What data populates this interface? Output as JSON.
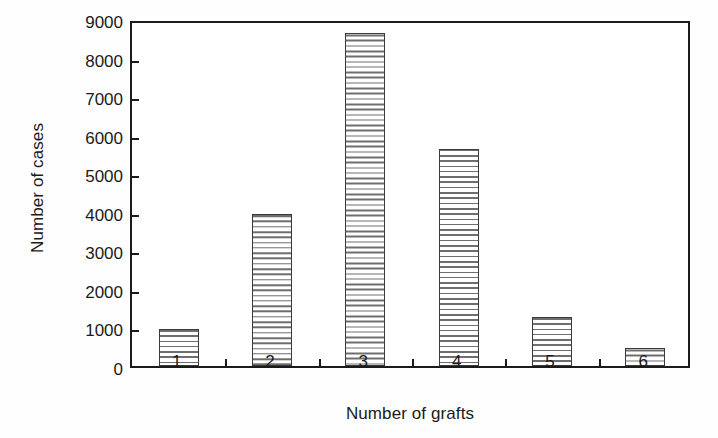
{
  "chart_data": {
    "type": "bar",
    "title": "",
    "xlabel": "Number of grafts",
    "ylabel": "Number of cases",
    "categories": [
      "1",
      "2",
      "3",
      "4",
      "5",
      "6"
    ],
    "values": [
      960,
      3950,
      8650,
      5620,
      1270,
      480
    ],
    "ylim": [
      0,
      9000
    ],
    "ytick_labels": [
      "0",
      "1000",
      "2000",
      "3000",
      "4000",
      "5000",
      "6000",
      "7000",
      "8000",
      "9000"
    ],
    "ytick_values": [
      0,
      1000,
      2000,
      3000,
      4000,
      5000,
      6000,
      7000,
      8000,
      9000
    ],
    "grid": false,
    "legend": null,
    "bar_fill": "horizontal-hatch",
    "colors": {
      "axis": "#1b1b1b",
      "bar_outline": "#3a3a3a",
      "bar_hatch": "#6e6e6e",
      "background": "#ffffff",
      "text": "#1a1a1a"
    }
  }
}
